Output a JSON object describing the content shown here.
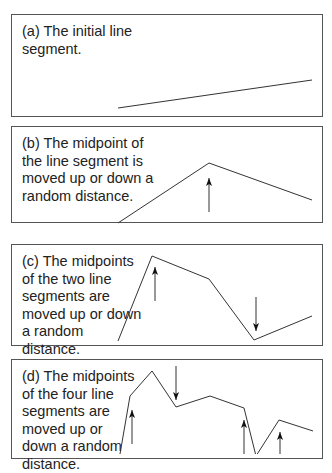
{
  "panels": [
    {
      "id": "a",
      "caption_lines": [
        "(a) The initial line",
        "segment."
      ],
      "box": {
        "top": 14,
        "height": 103
      },
      "polyline": [
        [
          118,
          108
        ],
        [
          312,
          80
        ]
      ],
      "arrows": []
    },
    {
      "id": "b",
      "caption_lines": [
        "(b) The midpoint of",
        "the line segment is",
        "moved up or down a",
        "random distance."
      ],
      "box": {
        "top": 126,
        "height": 97
      },
      "polyline": [
        [
          118,
          223
        ],
        [
          209,
          163
        ],
        [
          312,
          200
        ]
      ],
      "arrows": [
        {
          "x": 209,
          "from": 212,
          "to": 178,
          "dir": "up"
        }
      ]
    },
    {
      "id": "c",
      "caption_lines": [
        "(c) The midpoints",
        "of the two line",
        "segments are",
        "moved up or down",
        "a random",
        "distance."
      ],
      "box": {
        "top": 244,
        "height": 102
      },
      "polyline": [
        [
          118,
          341
        ],
        [
          152,
          256
        ],
        [
          209,
          279
        ],
        [
          254,
          340
        ],
        [
          312,
          316
        ]
      ],
      "arrows": [
        {
          "x": 155,
          "from": 301,
          "to": 267,
          "dir": "up"
        },
        {
          "x": 256,
          "from": 297,
          "to": 331,
          "dir": "down"
        }
      ]
    },
    {
      "id": "d",
      "caption_lines": [
        "(d) The midpoints",
        "of the four line",
        "segments are",
        "moved up or",
        "down a random",
        "distance."
      ],
      "box": {
        "top": 359,
        "height": 100
      },
      "polyline": [
        [
          120,
          454
        ],
        [
          130,
          396
        ],
        [
          152,
          371
        ],
        [
          176,
          407
        ],
        [
          210,
          396
        ],
        [
          244,
          408
        ],
        [
          256,
          456
        ],
        [
          279,
          420
        ],
        [
          313,
          431
        ]
      ],
      "arrows": [
        {
          "x": 132,
          "from": 444,
          "to": 410,
          "dir": "up"
        },
        {
          "x": 176,
          "from": 366,
          "to": 400,
          "dir": "down"
        },
        {
          "x": 244,
          "from": 456,
          "to": 420,
          "dir": "up"
        },
        {
          "x": 280,
          "from": 456,
          "to": 432,
          "dir": "up"
        }
      ]
    }
  ],
  "colors": {
    "line": "#333333",
    "border": "#555555",
    "text": "#222222"
  }
}
